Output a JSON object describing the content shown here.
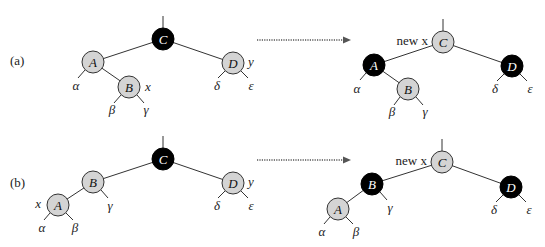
{
  "figure": {
    "cases": [
      {
        "label": "(a)",
        "before": {
          "nodes": [
            {
              "key": "C",
              "color": "black"
            },
            {
              "key": "A",
              "color": "red"
            },
            {
              "key": "B",
              "color": "red",
              "annotation": "x"
            },
            {
              "key": "D",
              "color": "red",
              "annotation": "y"
            }
          ],
          "subtrees": [
            "α",
            "β",
            "γ",
            "δ",
            "ε"
          ]
        },
        "after": {
          "nodes": [
            {
              "key": "C",
              "color": "red",
              "annotation": "new x"
            },
            {
              "key": "A",
              "color": "black"
            },
            {
              "key": "B",
              "color": "red"
            },
            {
              "key": "D",
              "color": "black"
            }
          ],
          "subtrees": [
            "α",
            "β",
            "γ",
            "δ",
            "ε"
          ]
        }
      },
      {
        "label": "(b)",
        "before": {
          "nodes": [
            {
              "key": "C",
              "color": "black"
            },
            {
              "key": "B",
              "color": "red"
            },
            {
              "key": "A",
              "color": "red",
              "annotation": "x"
            },
            {
              "key": "D",
              "color": "red",
              "annotation": "y"
            }
          ],
          "subtrees": [
            "α",
            "β",
            "γ",
            "δ",
            "ε"
          ]
        },
        "after": {
          "nodes": [
            {
              "key": "C",
              "color": "red",
              "annotation": "new x"
            },
            {
              "key": "B",
              "color": "black"
            },
            {
              "key": "A",
              "color": "red"
            },
            {
              "key": "D",
              "color": "black"
            }
          ],
          "subtrees": [
            "α",
            "β",
            "γ",
            "δ",
            "ε"
          ]
        }
      }
    ],
    "colors": {
      "red_node_fill": "#d4d4d4",
      "black_node_fill": "#000000",
      "edge": "#333333"
    }
  }
}
